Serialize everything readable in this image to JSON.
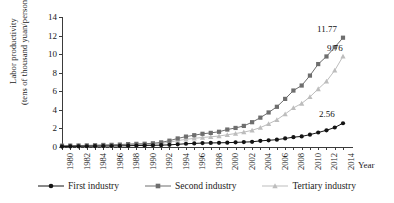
{
  "chart_data": {
    "type": "line",
    "title": "",
    "xlabel": "Year",
    "ylabel": "Labor productivity (tens of thousand yuan/person)",
    "ylabel_line1": "Labor productivity",
    "ylabel_line2": "(tens of thousand yuan/person)",
    "x": [
      1980,
      1981,
      1982,
      1983,
      1984,
      1985,
      1986,
      1987,
      1988,
      1989,
      1990,
      1991,
      1992,
      1993,
      1994,
      1995,
      1996,
      1997,
      1998,
      1999,
      2000,
      2001,
      2002,
      2003,
      2004,
      2005,
      2006,
      2007,
      2008,
      2009,
      2010,
      2011,
      2012,
      2013,
      2014
    ],
    "xticks": [
      "1980",
      "1982",
      "1984",
      "1986",
      "1988",
      "1990",
      "1992",
      "1994",
      "1996",
      "1998",
      "2000",
      "2002",
      "2004",
      "2006",
      "2008",
      "2010",
      "2012",
      "2014"
    ],
    "yticks": [
      0,
      2,
      4,
      6,
      8,
      10,
      12,
      14
    ],
    "ylim": [
      0,
      14
    ],
    "xlim": [
      1980,
      2014
    ],
    "grid": false,
    "legend_position": "bottom",
    "series": [
      {
        "name": "First industry",
        "color": "#141414",
        "marker": "circle",
        "values": [
          0.05,
          0.06,
          0.07,
          0.08,
          0.09,
          0.1,
          0.11,
          0.12,
          0.14,
          0.16,
          0.17,
          0.18,
          0.2,
          0.23,
          0.29,
          0.35,
          0.39,
          0.42,
          0.44,
          0.45,
          0.47,
          0.5,
          0.53,
          0.56,
          0.66,
          0.72,
          0.79,
          0.92,
          1.06,
          1.14,
          1.33,
          1.56,
          1.8,
          2.1,
          2.56
        ]
      },
      {
        "name": "Second industry",
        "color": "#6e6e6e",
        "marker": "square",
        "values": [
          0.14,
          0.15,
          0.16,
          0.17,
          0.19,
          0.22,
          0.23,
          0.26,
          0.31,
          0.34,
          0.35,
          0.4,
          0.5,
          0.68,
          0.92,
          1.12,
          1.27,
          1.42,
          1.52,
          1.64,
          1.88,
          2.05,
          2.27,
          2.67,
          3.16,
          3.72,
          4.33,
          5.18,
          6.08,
          6.62,
          7.69,
          8.93,
          9.75,
          10.74,
          11.77
        ]
      },
      {
        "name": "Tertiary industry",
        "color": "#bdbdbd",
        "marker": "triangle",
        "values": [
          0.12,
          0.13,
          0.14,
          0.15,
          0.16,
          0.18,
          0.19,
          0.21,
          0.25,
          0.27,
          0.28,
          0.31,
          0.38,
          0.52,
          0.69,
          0.82,
          0.93,
          1.03,
          1.1,
          1.18,
          1.32,
          1.45,
          1.6,
          1.8,
          2.09,
          2.49,
          2.93,
          3.55,
          4.21,
          4.69,
          5.4,
          6.25,
          7.07,
          8.25,
          9.76
        ]
      }
    ],
    "annotations": [
      {
        "text": "11.77",
        "series": "Second industry",
        "x": 2014,
        "y": 11.77
      },
      {
        "text": "9.76",
        "series": "Tertiary industry",
        "x": 2014,
        "y": 9.76
      },
      {
        "text": "2.56",
        "series": "First industry",
        "x": 2014,
        "y": 2.56
      }
    ]
  },
  "axis": {
    "y_title_line1": "Labor productivity",
    "y_title_line2": "(tens of thousand yuan/person)",
    "x_title": "Year"
  },
  "legend": {
    "items": [
      {
        "label": "First industry"
      },
      {
        "label": "Second industry"
      },
      {
        "label": "Tertiary industry"
      }
    ]
  }
}
